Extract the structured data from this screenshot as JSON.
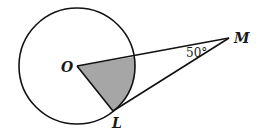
{
  "diagram": {
    "type": "geometry",
    "points": {
      "O": {
        "label": "O",
        "x": 77,
        "y": 66
      },
      "L": {
        "label": "L",
        "x": 113,
        "y": 111
      },
      "M": {
        "label": "M",
        "x": 229,
        "y": 38
      }
    },
    "circle": {
      "center": "O",
      "radius": 58
    },
    "segments": [
      "OM",
      "OL",
      "LM"
    ],
    "shaded_region": "sector bounded by OL, OM and arc",
    "angle_label": {
      "vertex": "M",
      "text": "50°"
    },
    "colors": {
      "stroke": "#111111",
      "shade": "#a6a6a6"
    }
  }
}
